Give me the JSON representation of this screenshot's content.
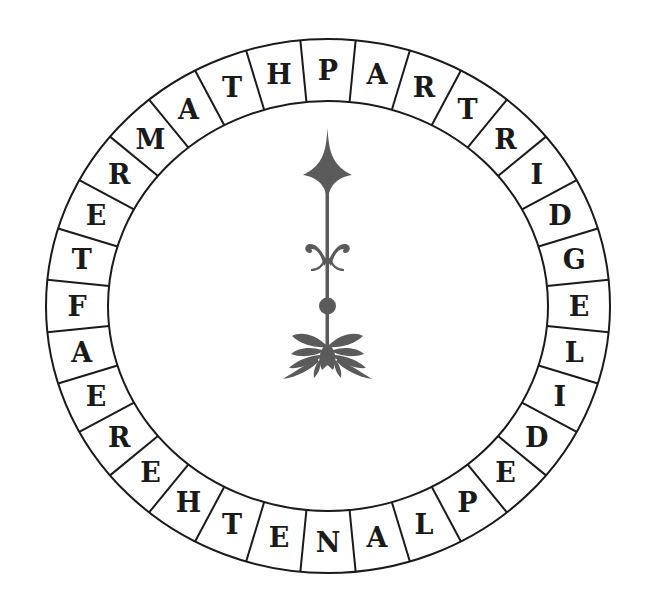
{
  "puzzle": {
    "type": "letter-wheel",
    "segment_count": 32,
    "start_position": "top",
    "direction": "clockwise",
    "letters": [
      "P",
      "A",
      "R",
      "T",
      "R",
      "I",
      "D",
      "G",
      "E",
      "L",
      "I",
      "D",
      "E",
      "P",
      "L",
      "A",
      "N",
      "E",
      "T",
      "H",
      "E",
      "R",
      "E",
      "A",
      "F",
      "T",
      "E",
      "R",
      "M",
      "A",
      "T",
      "H"
    ],
    "center_ornament": "decorative-pointer-ornament"
  },
  "colors": {
    "ring_fill": "#ffffff",
    "ring_stroke": "#1a1a1a",
    "letter_color": "#1a1a1a",
    "center_fill": "#d8d8d8",
    "ornament_color": "#5b5b5b",
    "background": "#ffffff"
  },
  "geometry": {
    "center_x": 328,
    "center_y": 306,
    "outer_rx": 282,
    "outer_ry": 267,
    "inner_rx": 220,
    "inner_ry": 205
  }
}
